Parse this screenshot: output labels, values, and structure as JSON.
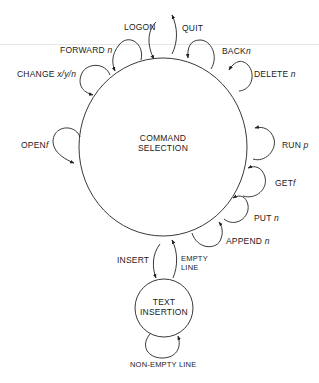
{
  "states": {
    "command_selection": {
      "line1": "COMMAND",
      "line2": "SELECTION"
    },
    "text_insertion": {
      "line1": "TEXT",
      "line2": "INSERTION"
    }
  },
  "transitions": {
    "logon": {
      "cmd": "LOGON",
      "arg": ""
    },
    "quit": {
      "cmd": "QUIT",
      "arg": ""
    },
    "forward": {
      "cmd": "FORWARD",
      "arg": "n"
    },
    "back": {
      "cmd": "BACK",
      "arg": "n"
    },
    "change": {
      "cmd": "CHANGE",
      "arg": "x/y/n"
    },
    "delete": {
      "cmd": "DELETE",
      "arg": "n"
    },
    "open": {
      "cmd": "OPEN",
      "arg": "f"
    },
    "run": {
      "cmd": "RUN",
      "arg": "p"
    },
    "get": {
      "cmd": "GET",
      "arg": "f"
    },
    "put": {
      "cmd": "PUT",
      "arg": "n"
    },
    "append": {
      "cmd": "APPEND",
      "arg": "n"
    },
    "insert": {
      "cmd": "INSERT",
      "arg": ""
    },
    "empty_line": {
      "line1": "EMPTY",
      "line2": "LINE"
    },
    "non_empty_line": {
      "cmd": "NON-EMPTY LINE"
    }
  }
}
